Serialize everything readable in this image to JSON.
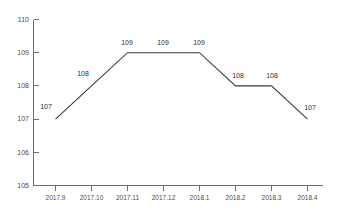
{
  "chart_data": {
    "type": "line",
    "title": "",
    "subtitle": "",
    "xlabel": "",
    "ylabel": "",
    "categories": [
      "2017.9",
      "2017.10",
      "2017.11",
      "2017.12",
      "2018.1",
      "2018.2",
      "2018.3",
      "2018.4"
    ],
    "values": [
      107,
      108,
      109,
      109,
      109,
      108,
      108,
      107
    ],
    "point_labels": [
      "107",
      "108",
      "109",
      "109",
      "109",
      "108",
      "108",
      "107"
    ],
    "series": [
      {
        "name": "",
        "values": [
          107,
          108,
          109,
          109,
          109,
          108,
          108,
          107
        ]
      }
    ],
    "ylim": [
      105,
      110
    ],
    "yticks": [
      105,
      106,
      107,
      108,
      109,
      110
    ],
    "ytick_labels": [
      "105",
      "106",
      "107",
      "108",
      "109",
      "110"
    ],
    "xtick_labels": [
      "2017.9",
      "2017.10",
      "2017.11",
      "2017.12",
      "2018.1",
      "2018.2",
      "2018.3",
      "2018.4"
    ],
    "grid": false,
    "legend": false,
    "legend_position": "none",
    "line_color": "#3b3b3b",
    "axis_color": "#6e6e6e",
    "label_color": "#4a4a4a",
    "background_color": "#ffffff",
    "markers": false,
    "data_labels_shown": true
  }
}
